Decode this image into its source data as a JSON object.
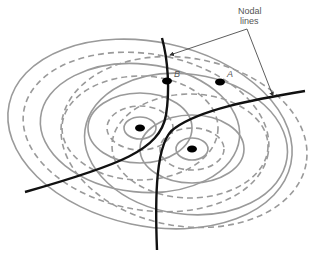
{
  "annotation": {
    "title_line1": "Nodal",
    "title_line2": "lines"
  },
  "points": {
    "A": "A",
    "B": "B"
  },
  "colors": {
    "wavefront": "#9a9a9a",
    "nodal_line": "#111111",
    "source": "#000000",
    "annotation": "#444444"
  },
  "sources": [
    {
      "x": 140,
      "y": 128
    },
    {
      "x": 192,
      "y": 149
    }
  ]
}
